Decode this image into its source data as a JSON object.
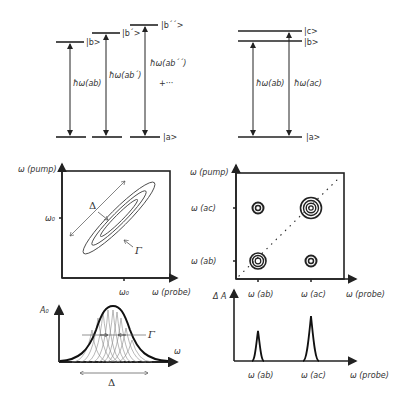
{
  "panel_a_left": {
    "levels": {
      "ground": "|a>",
      "b": "|b>",
      "b_prime": "|b´>",
      "b_dprime": "|b´´>"
    },
    "transitions": [
      "ħω(ab)",
      "ħω(ab´)",
      "ħω(ab´´)"
    ],
    "ellipsis": "+···"
  },
  "panel_a_right": {
    "levels": {
      "ground": "|a>",
      "b": "|b>",
      "c": "|c>"
    },
    "transitions": [
      "ħω(ab)",
      "ħω(ac)"
    ]
  },
  "panel_2d_left": {
    "y_axis": "ω (pump)",
    "x_axis": "ω (probe)",
    "y_tick": "ω₀",
    "x_tick": "ω₀",
    "delta_label": "Δ",
    "gamma_label": "Γ"
  },
  "panel_2d_right": {
    "y_axis": "ω (pump)",
    "x_axis": "ω (probe)",
    "y_ticks": [
      "ω (ac)",
      "ω (ab)"
    ],
    "x_ticks": [
      "ω (ab)",
      "ω (ac)"
    ]
  },
  "panel_1d_left": {
    "y_axis": "A₀",
    "x_axis": "ω",
    "gamma_label": "Γ",
    "delta_label": "Δ"
  },
  "panel_1d_right": {
    "y_axis": "Δ A",
    "x_axis": "ω (probe)",
    "x_ticks": [
      "ω (ab)",
      "ω (ac)"
    ]
  }
}
